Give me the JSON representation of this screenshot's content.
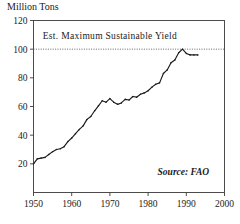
{
  "chart_data": {
    "type": "line",
    "title": "",
    "ylabel": "Million Tons",
    "xlabel": "",
    "xlim": [
      1950,
      2000
    ],
    "ylim": [
      0,
      120
    ],
    "grid": false,
    "legend": "none",
    "axis_color": "#3a3a3a",
    "line_color": "#1a1a1a",
    "annotation_line_color": "#555555",
    "yticks": [
      20,
      40,
      60,
      80,
      100,
      120
    ],
    "ytick_labels": [
      "20",
      "40",
      "60",
      "80",
      "100",
      "120"
    ],
    "xticks": [
      1950,
      1960,
      1970,
      1980,
      1990,
      2000
    ],
    "xtick_labels": [
      "1950",
      "1960",
      "1970",
      "1980",
      "1990",
      "2000"
    ],
    "annotations": [
      {
        "name": "msy-label",
        "text": "Est. Maximum Sustainable Yield",
        "x": 1970,
        "y": 107
      },
      {
        "name": "source-credit",
        "text": "Source: FAO",
        "x": 1996,
        "y": 12
      }
    ],
    "reference_lines": [
      {
        "name": "est-max-sustainable-yield",
        "orientation": "horizontal",
        "value": 100,
        "style": "dotted",
        "label": "Est. Maximum Sustainable Yield"
      }
    ],
    "series": [
      {
        "name": "World Fish Catch",
        "x": [
          1950,
          1951,
          1952,
          1953,
          1954,
          1955,
          1956,
          1957,
          1958,
          1959,
          1960,
          1961,
          1962,
          1963,
          1964,
          1965,
          1966,
          1967,
          1968,
          1969,
          1970,
          1971,
          1972,
          1973,
          1974,
          1975,
          1976,
          1977,
          1978,
          1979,
          1980,
          1981,
          1982,
          1983,
          1984,
          1985,
          1986,
          1987,
          1988,
          1989,
          1990,
          1991,
          1992,
          1993
        ],
        "values": [
          20.0,
          23.5,
          24.0,
          24.5,
          26.5,
          28.5,
          30.0,
          30.5,
          32.0,
          35.5,
          38.0,
          41.0,
          44.0,
          46.5,
          51.0,
          53.0,
          57.0,
          60.5,
          64.0,
          63.0,
          65.5,
          63.0,
          61.5,
          62.5,
          65.0,
          64.5,
          67.0,
          66.5,
          68.5,
          69.5,
          71.0,
          73.5,
          75.5,
          76.5,
          83.0,
          85.5,
          90.5,
          92.5,
          97.5,
          100.0,
          97.0,
          96.0,
          96.0,
          96.0
        ]
      }
    ]
  }
}
